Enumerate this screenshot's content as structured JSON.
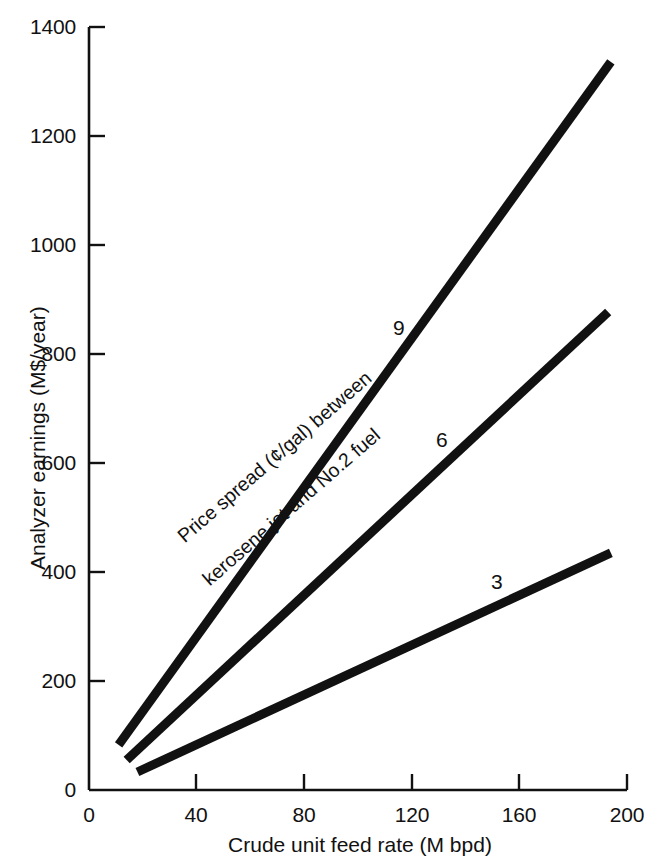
{
  "chart_data": {
    "type": "line",
    "title": "",
    "xlabel": "Crude unit feed rate (M bpd)",
    "ylabel": "Analyzer earnings (M$/year)",
    "xlim": [
      0,
      200
    ],
    "ylim": [
      0,
      1400
    ],
    "xticks": [
      0,
      40,
      80,
      120,
      160,
      200
    ],
    "yticks": [
      0,
      200,
      400,
      600,
      800,
      1000,
      1200,
      1400
    ],
    "xtick_labels": [
      "0",
      "40",
      "80",
      "120",
      "160",
      "200"
    ],
    "ytick_labels": [
      "0",
      "200",
      "400",
      "600",
      "800",
      "1000",
      "1200",
      "1400"
    ],
    "grid": false,
    "legend_position": "inline-end-labels",
    "annotation": {
      "line1": "Price spread (¢/gal) between",
      "line2": "kerosene jet and No.2 fuel",
      "rotation_deg": -41
    },
    "series": [
      {
        "name": "9",
        "label": "9",
        "units": "¢/gal price spread",
        "color": "#111111",
        "x": [
          11,
          194
        ],
        "y": [
          83,
          1336
        ]
      },
      {
        "name": "6",
        "label": "6",
        "units": "¢/gal price spread",
        "color": "#111111",
        "x": [
          14,
          193
        ],
        "y": [
          55,
          877
        ]
      },
      {
        "name": "3",
        "label": "3",
        "units": "¢/gal price spread",
        "color": "#111111",
        "x": [
          18,
          194
        ],
        "y": [
          33,
          435
        ]
      }
    ]
  },
  "axes": {
    "y_title": "Analyzer earnings (M$/year)",
    "x_title": "Crude unit feed rate (M bpd)",
    "y_tick_0": "0",
    "y_tick_1": "200",
    "y_tick_2": "400",
    "y_tick_3": "600",
    "y_tick_4": "800",
    "y_tick_5": "1000",
    "y_tick_6": "1200",
    "y_tick_7": "1400",
    "x_tick_0": "0",
    "x_tick_1": "40",
    "x_tick_2": "80",
    "x_tick_3": "120",
    "x_tick_4": "160",
    "x_tick_5": "200"
  },
  "series_labels": {
    "nine": "9",
    "six": "6",
    "three": "3"
  },
  "annotation": {
    "line1": "Price spread (¢/gal) between",
    "line2": "kerosene jet and No.2 fuel"
  },
  "colors": {
    "ink": "#111111",
    "background": "#ffffff"
  }
}
